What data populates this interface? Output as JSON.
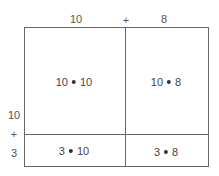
{
  "top_labels": {
    "left": "10",
    "op": "+",
    "right": "8"
  },
  "side_labels": {
    "top": "10",
    "op": "+",
    "bottom": "3"
  },
  "cells": [
    {
      "a": "10",
      "b": "10"
    },
    {
      "a": "10",
      "b": "8"
    },
    {
      "a": "3",
      "b": "10"
    },
    {
      "a": "3",
      "b": "8"
    }
  ],
  "colors": {
    "line": "#666666",
    "text": "#444444"
  }
}
